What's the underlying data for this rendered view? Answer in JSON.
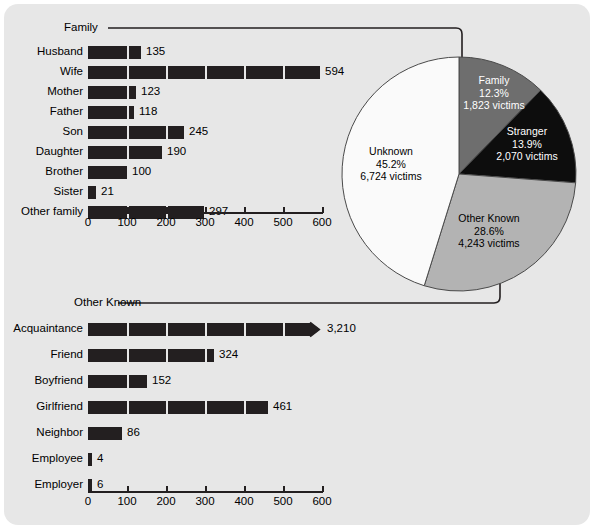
{
  "chart_data": [
    {
      "type": "bar",
      "orientation": "horizontal",
      "title": "Family",
      "xlabel": "",
      "ylabel": "",
      "xlim": [
        0,
        600
      ],
      "xticks": [
        0,
        100,
        200,
        300,
        400,
        500,
        600
      ],
      "xtick_labels": [
        "0",
        "100",
        "200",
        "300",
        "400",
        "500",
        "600"
      ],
      "grid": false,
      "bar_color": "#231f20",
      "categories": [
        "Husband",
        "Wife",
        "Mother",
        "Father",
        "Son",
        "Daughter",
        "Brother",
        "Sister",
        "Other family"
      ],
      "values": [
        135,
        594,
        123,
        118,
        245,
        190,
        100,
        21,
        297
      ],
      "value_labels": [
        "135",
        "594",
        "123",
        "118",
        "245",
        "190",
        "100",
        "21",
        "297"
      ]
    },
    {
      "type": "pie",
      "title": "",
      "legend_position": "inside-slices",
      "slices": [
        {
          "name": "Family",
          "percent": 12.3,
          "victims": 1823,
          "percent_label": "12.3%",
          "victims_label": "1,823 victims",
          "color": "#6e6e6e"
        },
        {
          "name": "Stranger",
          "percent": 13.9,
          "victims": 2070,
          "percent_label": "13.9%",
          "victims_label": "2,070 victims",
          "color": "#0d0d0d"
        },
        {
          "name": "Other Known",
          "percent": 28.6,
          "victims": 4243,
          "percent_label": "28.6%",
          "victims_label": "4,243 victims",
          "color": "#b3b3b3"
        },
        {
          "name": "Unknown",
          "percent": 45.2,
          "victims": 6724,
          "percent_label": "45.2%",
          "victims_label": "6,724 victims",
          "color": "#fafafa"
        }
      ]
    },
    {
      "type": "bar",
      "orientation": "horizontal",
      "title": "Other Known",
      "xlabel": "",
      "ylabel": "",
      "xlim": [
        0,
        600
      ],
      "xticks": [
        0,
        100,
        200,
        300,
        400,
        500,
        600
      ],
      "xtick_labels": [
        "0",
        "100",
        "200",
        "300",
        "400",
        "500",
        "600"
      ],
      "grid": false,
      "bar_color": "#231f20",
      "categories": [
        "Acquaintance",
        "Friend",
        "Boyfriend",
        "Girlfriend",
        "Neighbor",
        "Employee",
        "Employer"
      ],
      "values": [
        3210,
        324,
        152,
        461,
        86,
        4,
        6
      ],
      "value_labels": [
        "3,210",
        "324",
        "152",
        "461",
        "86",
        "4",
        "6"
      ],
      "axis_break_categories": [
        "Acquaintance"
      ]
    }
  ],
  "family_chart": {
    "section_label": "Family",
    "rows": [
      {
        "label": "Husband",
        "value": 135,
        "value_label": "135"
      },
      {
        "label": "Wife",
        "value": 594,
        "value_label": "594"
      },
      {
        "label": "Mother",
        "value": 123,
        "value_label": "123"
      },
      {
        "label": "Father",
        "value": 118,
        "value_label": "118"
      },
      {
        "label": "Son",
        "value": 245,
        "value_label": "245"
      },
      {
        "label": "Daughter",
        "value": 190,
        "value_label": "190"
      },
      {
        "label": "Brother",
        "value": 100,
        "value_label": "100"
      },
      {
        "label": "Sister",
        "value": 21,
        "value_label": "21"
      },
      {
        "label": "Other family",
        "value": 297,
        "value_label": "297"
      }
    ],
    "axis_labels": [
      "0",
      "100",
      "200",
      "300",
      "400",
      "500",
      "600"
    ]
  },
  "other_known_chart": {
    "section_label": "Other Known",
    "rows": [
      {
        "label": "Acquaintance",
        "value": 3210,
        "value_label": "3,210",
        "broken": true
      },
      {
        "label": "Friend",
        "value": 324,
        "value_label": "324",
        "broken": false
      },
      {
        "label": "Boyfriend",
        "value": 152,
        "value_label": "152",
        "broken": false
      },
      {
        "label": "Girlfriend",
        "value": 461,
        "value_label": "461",
        "broken": false
      },
      {
        "label": "Neighbor",
        "value": 86,
        "value_label": "86",
        "broken": false
      },
      {
        "label": "Employee",
        "value": 4,
        "value_label": "4",
        "broken": false
      },
      {
        "label": "Employer",
        "value": 6,
        "value_label": "6",
        "broken": false
      }
    ],
    "axis_labels": [
      "0",
      "100",
      "200",
      "300",
      "400",
      "500",
      "600"
    ]
  },
  "pie": {
    "slices": [
      {
        "name": "Family",
        "percent_label": "12.3%",
        "victims_label": "1,823 victims"
      },
      {
        "name": "Stranger",
        "percent_label": "13.9%",
        "victims_label": "2,070 victims"
      },
      {
        "name": "Other Known",
        "percent_label": "28.6%",
        "victims_label": "4,243 victims"
      },
      {
        "name": "Unknown",
        "percent_label": "45.2%",
        "victims_label": "6,724 victims"
      }
    ]
  },
  "colors": {
    "panel": "#e7e7e7",
    "bar": "#231f20",
    "family_slice": "#6e6e6e",
    "stranger_slice": "#0d0d0d",
    "other_known_slice": "#b3b3b3",
    "unknown_slice": "#fafafa"
  }
}
